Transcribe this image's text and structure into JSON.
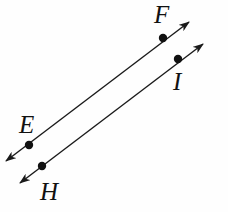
{
  "figure": {
    "width": 228,
    "height": 212,
    "background_color": "#fefefe",
    "stroke_color": "#1a1a1a",
    "point_color": "#111111",
    "stroke_width": 1.4,
    "point_radius": 4.2
  },
  "labels": {
    "F": "F",
    "I": "I",
    "E": "E",
    "H": "H"
  },
  "geometry": {
    "lines": [
      {
        "name": "line-EF",
        "through_points": [
          "E",
          "F"
        ],
        "arrow_start": {
          "x": 6,
          "y": 161
        },
        "arrow_end": {
          "x": 189,
          "y": 22
        },
        "double_headed": true
      },
      {
        "name": "line-HI",
        "through_points": [
          "H",
          "I"
        ],
        "arrow_start": {
          "x": 20,
          "y": 183
        },
        "arrow_end": {
          "x": 203,
          "y": 44
        },
        "double_headed": true
      }
    ],
    "points": [
      {
        "name": "F",
        "x": 163,
        "y": 38,
        "on_line": "line-EF"
      },
      {
        "name": "I",
        "x": 178,
        "y": 59,
        "on_line": "line-HI"
      },
      {
        "name": "E",
        "x": 29,
        "y": 145,
        "on_line": "line-EF"
      },
      {
        "name": "H",
        "x": 42,
        "y": 166,
        "on_line": "line-HI"
      }
    ]
  }
}
